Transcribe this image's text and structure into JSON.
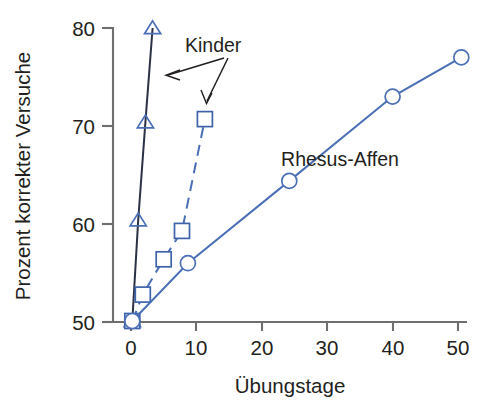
{
  "chart_data": {
    "type": "line",
    "title": "",
    "subtitle": "",
    "xlabel": "Übungstage",
    "ylabel": "Prozent korrekter Versuche",
    "xlim": [
      0,
      52
    ],
    "ylim": [
      50,
      80
    ],
    "xticks": [
      "0",
      "10",
      "20",
      "30",
      "40",
      "50"
    ],
    "xtick_values": [
      0,
      10,
      20,
      30,
      40,
      50
    ],
    "yticks": [
      "50",
      "60",
      "70",
      "80"
    ],
    "ytick_values": [
      50,
      60,
      70,
      80
    ],
    "grid": false,
    "legend_position": "inline-annotations",
    "series": [
      {
        "name": "Kinder",
        "marker": "triangle",
        "linestyle": "solid",
        "color": "#2b3245",
        "x": [
          0.2,
          1.1,
          2.2,
          3.3
        ],
        "y": [
          50.1,
          60.4,
          70.4,
          80.0
        ]
      },
      {
        "name": "Kinder",
        "marker": "square",
        "linestyle": "dashed",
        "color": "#4a6fb5",
        "x": [
          0.2,
          1.8,
          5.0,
          7.8,
          11.3
        ],
        "y": [
          50.1,
          52.8,
          56.4,
          59.3,
          70.7
        ]
      },
      {
        "name": "Rhesus-Affen",
        "marker": "circle",
        "linestyle": "solid",
        "color": "#4a6fb5",
        "x": [
          0.2,
          8.7,
          24.2,
          40.0,
          50.5
        ],
        "y": [
          50.1,
          56.0,
          64.4,
          73.0,
          77.0
        ]
      }
    ],
    "annotations": [
      {
        "text": "Kinder",
        "x": 13.0,
        "y": 77.6,
        "points_to": [
          "triangle-series",
          "square-series"
        ]
      },
      {
        "text": "Rhesus-Affen",
        "x": 26.5,
        "y": 66.4,
        "points_to": [
          "circle-series"
        ]
      }
    ]
  },
  "axes": {
    "x_title": "Übungstage",
    "y_title": "Prozent korrekter Versuche",
    "x_tick_labels": [
      "0",
      "10",
      "20",
      "30",
      "40",
      "50"
    ],
    "y_tick_labels": [
      "50",
      "60",
      "70",
      "80"
    ]
  },
  "labels": {
    "kinder": "Kinder",
    "rhesus": "Rhesus-Affen"
  },
  "colors": {
    "triangle_line": "#2b3245",
    "square_line": "#4a6fb5",
    "circle_line": "#4a6fb5",
    "axis": "#6e6e6e",
    "text": "#231f20",
    "background": "#ffffff"
  }
}
